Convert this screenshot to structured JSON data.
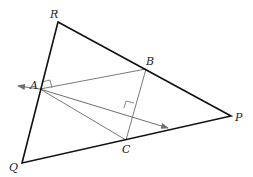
{
  "diagram": {
    "type": "geometry",
    "labels": {
      "R": "R",
      "A": "A",
      "B": "B",
      "P": "P",
      "Q": "Q",
      "C": "C"
    },
    "points": {
      "R": [
        58,
        22
      ],
      "P": [
        231,
        116
      ],
      "Q": [
        22,
        163
      ],
      "A": [
        40,
        89
      ],
      "B": [
        146,
        69
      ],
      "C": [
        126,
        140
      ]
    },
    "colors": {
      "triangle": "#111111",
      "inner": "#7a7a7a"
    }
  }
}
